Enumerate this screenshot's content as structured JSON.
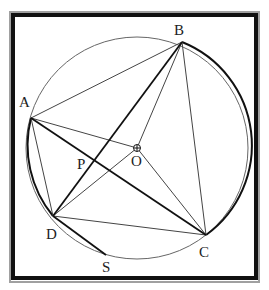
{
  "figure": {
    "frame": {
      "x": 13,
      "y": 15,
      "w": 243,
      "h": 263,
      "color": "#111111",
      "shadow": "#9a9a9a"
    },
    "circle": {
      "cx": 137,
      "cy": 148,
      "r": 111,
      "color": "#555555"
    },
    "points": {
      "A": {
        "x": 31,
        "y": 118,
        "label": "A",
        "lx": 19,
        "ly": 107
      },
      "B": {
        "x": 182,
        "y": 42,
        "label": "B",
        "lx": 174,
        "ly": 35
      },
      "C": {
        "x": 206,
        "y": 235,
        "label": "C",
        "lx": 199,
        "ly": 257
      },
      "D": {
        "x": 53,
        "y": 216,
        "label": "D",
        "lx": 46,
        "ly": 239
      },
      "O": {
        "x": 137,
        "y": 148,
        "label": "O",
        "lx": 131,
        "ly": 166
      },
      "P": {
        "x": 94,
        "y": 160,
        "label": "P",
        "lx": 77,
        "ly": 169
      },
      "S": {
        "x": 106,
        "y": 255,
        "label": "S",
        "lx": 102,
        "ly": 272
      }
    },
    "labels": [
      "A",
      "B",
      "C",
      "D",
      "O",
      "P",
      "S"
    ]
  }
}
